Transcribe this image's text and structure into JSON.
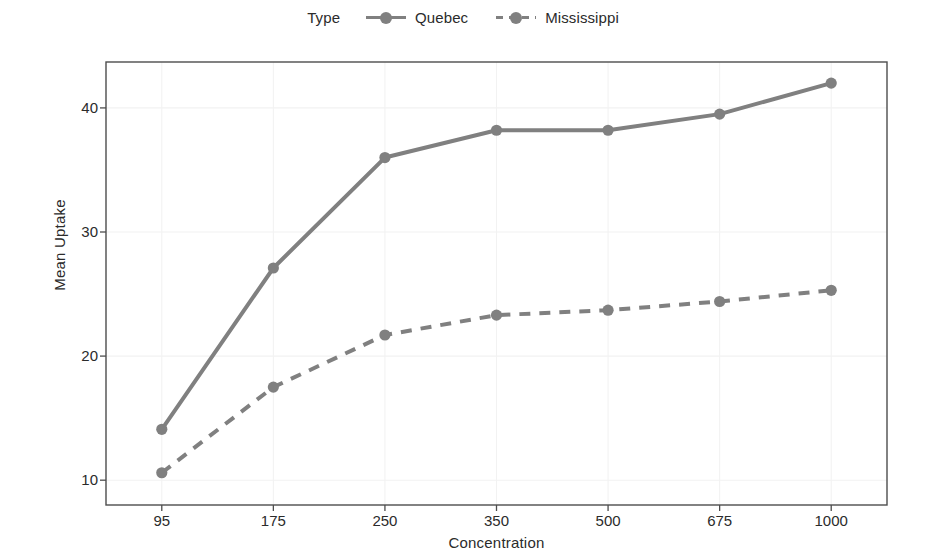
{
  "chart_data": {
    "type": "line",
    "title": "",
    "xlabel": "Concentration",
    "ylabel": "Mean Uptake",
    "categories": [
      "95",
      "175",
      "250",
      "350",
      "500",
      "675",
      "1000"
    ],
    "series": [
      {
        "name": "Quebec",
        "values": [
          14.1,
          27.1,
          36.0,
          38.2,
          38.2,
          39.5,
          42.0
        ],
        "linestyle": "solid",
        "color": "#808080"
      },
      {
        "name": "Mississippi",
        "values": [
          10.6,
          17.5,
          21.7,
          23.3,
          23.7,
          24.4,
          25.3
        ],
        "linestyle": "dashed",
        "color": "#808080"
      }
    ],
    "ylim": [
      8.0,
      43.7
    ],
    "yticks": [
      10,
      20,
      30,
      40
    ],
    "ytick_labels": [
      "10",
      "20",
      "30",
      "40"
    ],
    "grid": true,
    "grid_color": "#f2f2f2",
    "legend": {
      "position": "top",
      "title": "Type",
      "entries": [
        "Quebec",
        "Mississippi"
      ]
    },
    "panel_border_color": "#4d4d4d",
    "background": "#ffffff"
  },
  "legend": {
    "title": "Type",
    "entries": [
      {
        "label": "Quebec",
        "style": "solid"
      },
      {
        "label": "Mississippi",
        "style": "dashed"
      }
    ]
  },
  "axes": {
    "y_title": "Mean Uptake",
    "x_title": "Concentration",
    "y_ticks": [
      "10",
      "20",
      "30",
      "40"
    ],
    "x_ticks": [
      "95",
      "175",
      "250",
      "350",
      "500",
      "675",
      "1000"
    ]
  }
}
